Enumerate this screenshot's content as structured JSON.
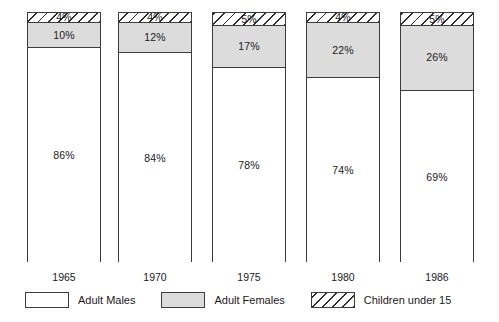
{
  "chart_data": {
    "type": "bar",
    "subtype": "stacked-bar-100-percent",
    "title": "",
    "subtitle": "",
    "xlabel": "",
    "ylabel": "",
    "ylim": [
      0,
      100
    ],
    "grid": false,
    "legend_position": "bottom",
    "categories": [
      "1965",
      "1970",
      "1975",
      "1980",
      "1986"
    ],
    "series": [
      {
        "name": "Adult Males",
        "values": [
          86,
          84,
          78,
          74,
          69
        ],
        "fill": "white",
        "color": "#ffffff"
      },
      {
        "name": "Adult Females",
        "values": [
          10,
          12,
          17,
          22,
          26
        ],
        "fill": "grey",
        "color": "#dcdcdc"
      },
      {
        "name": "Children under 15",
        "values": [
          4,
          4,
          5,
          4,
          5
        ],
        "fill": "hatched",
        "color": "#ffffff"
      }
    ],
    "value_suffix": "%",
    "annotations": []
  },
  "bars": [
    {
      "year": "1965",
      "males_label": "86%",
      "females_label": "10%",
      "children_label": "4%",
      "males_pct": 86,
      "females_pct": 10,
      "children_pct": 4
    },
    {
      "year": "1970",
      "males_label": "84%",
      "females_label": "12%",
      "children_label": "4%",
      "males_pct": 84,
      "females_pct": 12,
      "children_pct": 4
    },
    {
      "year": "1975",
      "males_label": "78%",
      "females_label": "17%",
      "children_label": "5%",
      "males_pct": 78,
      "females_pct": 17,
      "children_pct": 5
    },
    {
      "year": "1980",
      "males_label": "74%",
      "females_label": "22%",
      "children_label": "4%",
      "males_pct": 74,
      "females_pct": 22,
      "children_pct": 4
    },
    {
      "year": "1986",
      "males_label": "69%",
      "females_label": "26%",
      "children_label": "5%",
      "males_pct": 69,
      "females_pct": 26,
      "children_pct": 5
    }
  ],
  "legend": {
    "items": [
      {
        "label": "Adult Males",
        "swatch": "white-swatch"
      },
      {
        "label": "Adult Females",
        "swatch": "grey-swatch"
      },
      {
        "label": "Children under 15",
        "swatch": "hatched-swatch"
      }
    ]
  },
  "colors": {
    "males": "#ffffff",
    "females": "#dcdcdc",
    "children_hatch": "#2b2b2b",
    "outline": "#3c3c3c",
    "text": "#1a1a1a",
    "background": "#ffffff"
  }
}
